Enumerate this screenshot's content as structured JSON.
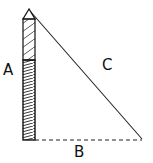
{
  "diagram": {
    "type": "right-triangle-pole",
    "labels": {
      "side_a": "A",
      "side_b": "B",
      "side_c": "C"
    },
    "colors": {
      "stroke": "#111111",
      "background": "#ffffff"
    }
  }
}
